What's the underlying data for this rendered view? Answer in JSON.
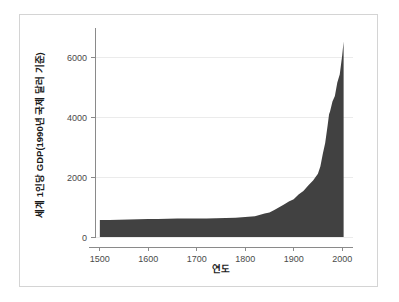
{
  "chart_data": {
    "type": "area",
    "title": "",
    "xlabel": "연도",
    "ylabel": "세계 1인당 GDP(1990년 국제 달러 기준)",
    "xlim": [
      1490,
      2010
    ],
    "ylim": [
      0,
      6800
    ],
    "xticks": [
      1500,
      1600,
      1700,
      1800,
      1900,
      2000
    ],
    "xticklabels": [
      "1500",
      "1600",
      "1700",
      "1800",
      "1900",
      "2000"
    ],
    "yticks": [
      0,
      2000,
      4000,
      6000
    ],
    "yticklabels": [
      "0",
      "2000",
      "4000",
      "6000"
    ],
    "grid": true,
    "grid_axis": "y",
    "legend": "none",
    "fill_color": "#414141",
    "axis_color": "#8a8a8a",
    "grid_color": "#ebebeb",
    "frame_color": "#d4d4d4",
    "background_color": "#ffffff",
    "x": [
      1500,
      1520,
      1540,
      1560,
      1580,
      1600,
      1620,
      1640,
      1660,
      1680,
      1700,
      1720,
      1740,
      1760,
      1780,
      1800,
      1820,
      1840,
      1850,
      1860,
      1870,
      1880,
      1890,
      1900,
      1910,
      1920,
      1930,
      1940,
      1950,
      1955,
      1960,
      1965,
      1970,
      1973,
      1975,
      1980,
      1985,
      1990,
      1995,
      2000,
      2003
    ],
    "values": [
      566,
      570,
      575,
      580,
      588,
      596,
      602,
      608,
      614,
      620,
      615,
      620,
      628,
      636,
      645,
      667,
      690,
      780,
      818,
      900,
      990,
      1080,
      1180,
      1262,
      1420,
      1530,
      1720,
      1880,
      2111,
      2350,
      2770,
      3130,
      3720,
      4091,
      4180,
      4520,
      4700,
      5150,
      5420,
      6038,
      6516
    ],
    "series": [
      {
        "name": "세계 1인당 GDP",
        "values": [
          566,
          570,
          575,
          580,
          588,
          596,
          602,
          608,
          614,
          620,
          615,
          620,
          628,
          636,
          645,
          667,
          690,
          780,
          818,
          900,
          990,
          1080,
          1180,
          1262,
          1420,
          1530,
          1720,
          1880,
          2111,
          2350,
          2770,
          3130,
          3720,
          4091,
          4180,
          4520,
          4700,
          5150,
          5420,
          6038,
          6516
        ]
      }
    ],
    "annotations": []
  },
  "layout": {
    "plot_left": 95,
    "plot_right": 347,
    "plot_top": 33,
    "plot_bottom": 237
  }
}
